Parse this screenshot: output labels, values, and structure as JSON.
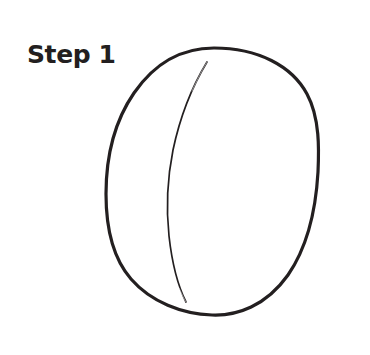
{
  "figure": {
    "title": "Step 1",
    "kind": "line-drawing",
    "background_color": "#ffffff",
    "ink_color": "#231f20"
  },
  "label": {
    "text": "Step 1",
    "color": "#231f20",
    "x": 27,
    "y": 40
  },
  "strokes": {
    "outer_outline": {
      "name": "ball-outline",
      "color": "#231f20",
      "width": 3.2,
      "closed": true,
      "bounds": {
        "left": 106,
        "top": 48,
        "right": 319,
        "bottom": 315
      },
      "path": "M 214 48 C 258 48 292 66 307 94 C 320 118 319 150 318 172 C 316 207 308 246 288 275 C 266 306 237 316 212 315 C 182 314 151 302 131 279 C 111 256 106 224 106 194 C 106 160 112 125 134 93 C 154 64 181 48 214 48 Z"
    },
    "inner_contour": {
      "name": "ball-contour-line",
      "color": "#231f20",
      "width": 1.6,
      "closed": false,
      "endpoints": [
        {
          "x": 207,
          "y": 62
        },
        {
          "x": 186,
          "y": 302
        }
      ],
      "apex": {
        "x": 168,
        "y": 190
      },
      "path": "M 207 62 C 193 85 180 117 173 150 C 167 180 166 208 169 236 C 172 263 178 286 186 302"
    }
  }
}
